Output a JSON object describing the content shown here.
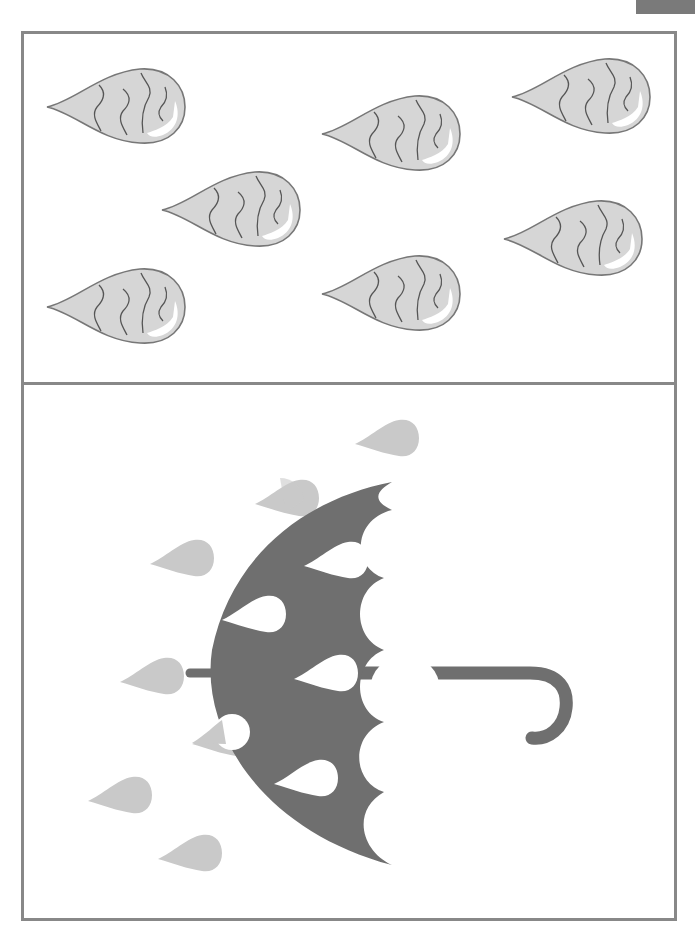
{
  "worksheet": {
    "title": "",
    "corner_tab_label": "",
    "top_panel": {
      "description": "Raindrops with wavy lines",
      "drop_count": 7,
      "drops": [
        {
          "x": 45,
          "y": 65,
          "w": 140,
          "h": 80
        },
        {
          "x": 320,
          "y": 92,
          "w": 142,
          "h": 82
        },
        {
          "x": 510,
          "y": 55,
          "w": 140,
          "h": 80
        },
        {
          "x": 160,
          "y": 168,
          "w": 140,
          "h": 82
        },
        {
          "x": 502,
          "y": 197,
          "w": 140,
          "h": 82
        },
        {
          "x": 45,
          "y": 265,
          "w": 140,
          "h": 80
        },
        {
          "x": 320,
          "y": 252,
          "w": 140,
          "h": 80
        }
      ]
    },
    "bottom_panel": {
      "description": "Umbrella in the rain",
      "falling_drops": [
        {
          "x": 355,
          "y": 418
        },
        {
          "x": 255,
          "y": 478
        },
        {
          "x": 150,
          "y": 538
        },
        {
          "x": 120,
          "y": 656
        },
        {
          "x": 192,
          "y": 718
        },
        {
          "x": 88,
          "y": 775
        },
        {
          "x": 158,
          "y": 833
        }
      ]
    },
    "colors": {
      "border": "#888888",
      "drop_fill": "#d4d4d4",
      "drop_stroke": "#777777",
      "umbrella": "#707070",
      "rain": "#c8c8c8",
      "tab": "#7a7a7a"
    }
  }
}
